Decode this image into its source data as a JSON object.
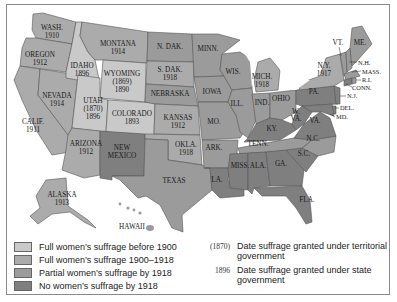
{
  "colors": {
    "full_before_1900": "#c9c9c9",
    "full_1900_1918": "#ababab",
    "partial_by_1918": "#9b9b9b",
    "none_by_1918": "#7f7f7f",
    "water": "#ffffff",
    "border": "#555555"
  },
  "states": {
    "wash": {
      "name": "WASH.",
      "year": "1910"
    },
    "oregon": {
      "name": "OREGON",
      "year": "1912"
    },
    "calif": {
      "name": "CALIF.",
      "year": "1911"
    },
    "nevada": {
      "name": "NEVADA",
      "year": "1914"
    },
    "idaho": {
      "name": "IDAHO",
      "year": "1896"
    },
    "montana": {
      "name": "MONTANA",
      "year": "1914"
    },
    "wyoming": {
      "name": "WYOMING",
      "territorial_year": "(1869)",
      "year": "1890"
    },
    "utah": {
      "name": "UTAH",
      "territorial_year": "(1870)",
      "year": "1896"
    },
    "colorado": {
      "name": "COLORADO",
      "year": "1893"
    },
    "arizona": {
      "name": "ARIZONA",
      "year": "1912"
    },
    "new_mexico": {
      "name_line1": "NEW",
      "name_line2": "MEXICO"
    },
    "n_dak": {
      "name": "N. DAK."
    },
    "s_dak": {
      "name": "S. DAK.",
      "year": "1918"
    },
    "nebraska": {
      "name": "NEBRASKA"
    },
    "kansas": {
      "name": "KANSAS",
      "year": "1912"
    },
    "okla": {
      "name": "OKLA.",
      "year": "1918"
    },
    "texas": {
      "name": "TEXAS"
    },
    "minn": {
      "name": "MINN."
    },
    "iowa": {
      "name": "IOWA"
    },
    "mo": {
      "name": "MO."
    },
    "ark": {
      "name": "ARK."
    },
    "la": {
      "name": "LA."
    },
    "wis": {
      "name": "WIS."
    },
    "ill": {
      "name": "ILL."
    },
    "mich": {
      "name": "MICH.",
      "year": "1918"
    },
    "ind": {
      "name": "IND."
    },
    "ohio": {
      "name": "OHIO"
    },
    "ky": {
      "name": "KY."
    },
    "tenn": {
      "name": "TENN."
    },
    "miss": {
      "name": "MISS."
    },
    "ala": {
      "name": "ALA."
    },
    "ga": {
      "name": "GA."
    },
    "fla": {
      "name": "FLA."
    },
    "sc": {
      "name": "S.C."
    },
    "nc": {
      "name": "N.C."
    },
    "va": {
      "name": "VA."
    },
    "wva": {
      "name_line1": "W.",
      "name_line2": "VA."
    },
    "pa": {
      "name": "PA."
    },
    "ny": {
      "name": "N.Y.",
      "year": "1917"
    },
    "vt": {
      "name": "VT."
    },
    "me": {
      "name": "ME."
    },
    "nh": {
      "name": "N.H."
    },
    "mass": {
      "name": "MASS."
    },
    "ri": {
      "name": "R.I."
    },
    "conn": {
      "name": "CONN."
    },
    "nj": {
      "name": "N.J."
    },
    "del": {
      "name": "DEL."
    },
    "md": {
      "name": "MD."
    },
    "alaska": {
      "name": "ALASKA",
      "year": "1913"
    },
    "hawaii": {
      "name": "HAWAII"
    }
  },
  "legend": {
    "items": [
      {
        "label": "Full women’s suffrage before 1900"
      },
      {
        "label": "Full women’s suffrage 1900–1918"
      },
      {
        "label": "Partial women’s suffrage by 1918"
      },
      {
        "label": "No women’s suffrage by 1918"
      }
    ],
    "key": [
      {
        "sample": "(1870)",
        "text": "Date suffrage granted under territorial government"
      },
      {
        "sample": "1896",
        "text": "Date suffrage granted under state government"
      }
    ]
  }
}
